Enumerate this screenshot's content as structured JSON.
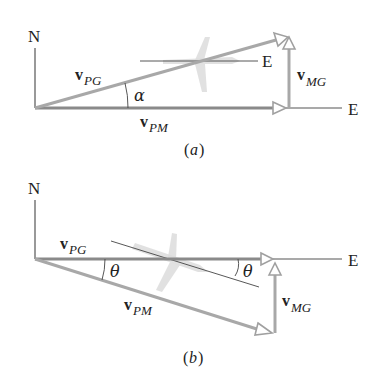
{
  "diagram_a": {
    "caption_open": "(",
    "caption_letter": "a",
    "caption_close": ")",
    "north_label": "N",
    "east_label": "E",
    "plane_heading_label": "E",
    "angle_label": "α",
    "vectors": {
      "pg": {
        "bold": "v",
        "sub": "PG"
      },
      "pm": {
        "bold": "v",
        "sub": "PM"
      },
      "mg": {
        "bold": "v",
        "sub": "MG"
      }
    }
  },
  "diagram_b": {
    "caption_open": "(",
    "caption_letter": "b",
    "caption_close": ")",
    "north_label": "N",
    "east_label": "E",
    "angle_label_left": "θ",
    "angle_label_right": "θ",
    "vectors": {
      "pg": {
        "bold": "v",
        "sub": "PG"
      },
      "pm": {
        "bold": "v",
        "sub": "PM"
      },
      "mg": {
        "bold": "v",
        "sub": "MG"
      }
    }
  }
}
